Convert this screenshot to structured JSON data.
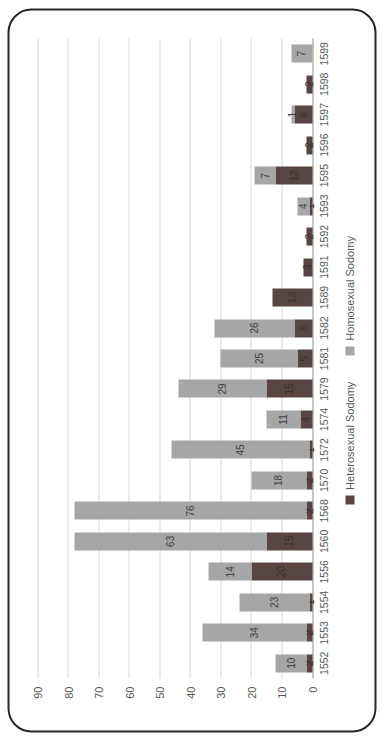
{
  "chart_data": {
    "type": "bar",
    "stacked": true,
    "render_rotation_deg": -90,
    "title": "",
    "xlabel": "",
    "ylabel": "",
    "categories": [
      "1552",
      "1553",
      "1554",
      "1556",
      "1560",
      "1568",
      "1570",
      "1572",
      "1574",
      "1579",
      "1581",
      "1582",
      "1589",
      "1591",
      "1592",
      "1593",
      "1595",
      "1596",
      "1597",
      "1598",
      "1599"
    ],
    "series": [
      {
        "name": "Heterosexual Sodomy",
        "color": "#584440",
        "values": [
          2,
          2,
          1,
          20,
          15,
          2,
          2,
          1,
          4,
          15,
          5,
          6,
          13,
          3,
          2,
          1,
          12,
          2,
          6,
          2,
          0
        ]
      },
      {
        "name": "Homosexual Sodomy",
        "color": "#a6a6a6",
        "values": [
          10,
          34,
          23,
          14,
          63,
          76,
          18,
          45,
          11,
          29,
          25,
          26,
          0,
          0,
          0,
          4,
          7,
          0,
          1,
          0,
          7
        ]
      }
    ],
    "ylim": [
      0,
      90
    ],
    "ytick_step": 10,
    "ytick_labels": [
      "0",
      "10",
      "20",
      "30",
      "40",
      "50",
      "60",
      "70",
      "80",
      "90"
    ],
    "grid": true,
    "data_labels": true,
    "legend_position": "bottom"
  },
  "colors": {
    "background": "#ffffff",
    "frame_border": "#262626",
    "gridline": "#d9d9d9",
    "axis_line": "#8c8c8c",
    "tick_text": "#595959",
    "label_on_gray": "#404040",
    "label_on_dark": "#39302d"
  }
}
